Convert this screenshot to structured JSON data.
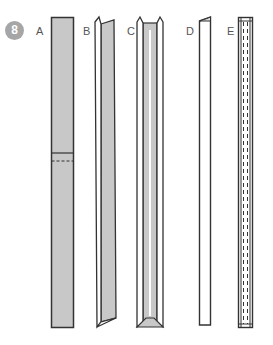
{
  "figure": {
    "step_number": "8",
    "colors": {
      "outline": "#333333",
      "fill": "#c8c8c8",
      "badge": "#a6a6a6",
      "background": "#ffffff"
    },
    "parts": [
      {
        "label": "A",
        "description": "flat gray strip with fold line and dashed crease"
      },
      {
        "label": "B",
        "description": "strip with one edge folded over"
      },
      {
        "label": "C",
        "description": "strip with both edges folded (channel)"
      },
      {
        "label": "D",
        "description": "narrow folded strip, white"
      },
      {
        "label": "E",
        "description": "narrow strip with dashed inner lines"
      }
    ]
  }
}
